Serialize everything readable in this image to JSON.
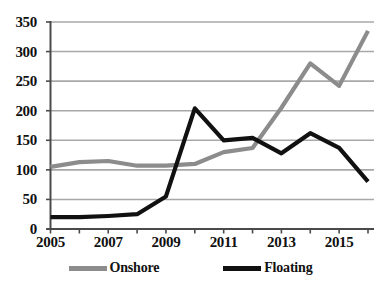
{
  "chart_data": {
    "type": "line",
    "title": "",
    "xlabel": "",
    "ylabel": "",
    "x": [
      2005,
      2006,
      2007,
      2008,
      2009,
      2010,
      2011,
      2012,
      2013,
      2014,
      2015,
      2016
    ],
    "xlim": [
      2005,
      2016
    ],
    "ylim": [
      0,
      350
    ],
    "y_ticks": [
      0,
      50,
      100,
      150,
      200,
      250,
      300,
      350
    ],
    "x_tick_labels": [
      "2005",
      "2007",
      "2009",
      "2011",
      "2013",
      "2015"
    ],
    "x_tick_values": [
      2005,
      2007,
      2009,
      2011,
      2013,
      2015
    ],
    "grid": true,
    "legend_position": "bottom",
    "series": [
      {
        "name": "Onshore",
        "color": "#8c8c8c",
        "values": [
          105,
          113,
          115,
          107,
          107,
          110,
          130,
          137,
          205,
          280,
          242,
          335
        ]
      },
      {
        "name": "Floating",
        "color": "#111111",
        "values": [
          20,
          20,
          22,
          25,
          55,
          204,
          150,
          154,
          128,
          162,
          137,
          80
        ]
      }
    ]
  },
  "legend": {
    "items": [
      {
        "label": "Onshore",
        "color": "#8c8c8c"
      },
      {
        "label": "Floating",
        "color": "#111111"
      }
    ]
  },
  "axes": {
    "y_labels": [
      "350",
      "300",
      "250",
      "200",
      "150",
      "100",
      "50",
      "0"
    ],
    "x_labels": [
      "2005",
      "2007",
      "2009",
      "2011",
      "2013",
      "2015"
    ]
  },
  "colors": {
    "background": "#ffffff",
    "grid": "#a8a8a8",
    "axis": "#4a4a4a",
    "onshore": "#8c8c8c",
    "floating": "#111111"
  }
}
